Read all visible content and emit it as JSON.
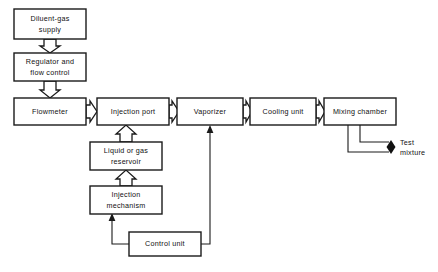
{
  "figure": {
    "type": "block-flow-diagram",
    "background": "#ffffff",
    "line_color": "#1a1a1a",
    "text_color": "#111111",
    "width": 438,
    "height": 272
  },
  "boxes": {
    "diluent_gas_supply": {
      "label": "Diluent-gas supply",
      "line1": "Diluent-gas",
      "line2": "supply",
      "x": 14,
      "y": 9,
      "w": 72,
      "h": 30
    },
    "regulator_flow_control": {
      "label": "Regulator and flow control",
      "line1": "Regulator and",
      "line2": "flow control",
      "x": 14,
      "y": 53,
      "w": 72,
      "h": 28
    },
    "flowmeter": {
      "label": "Flowmeter",
      "line1": "Flowmeter",
      "line2": "",
      "x": 14,
      "y": 98,
      "w": 72,
      "h": 27
    },
    "injection_port": {
      "label": "Injection port",
      "line1": "Injection port",
      "line2": "",
      "x": 97,
      "y": 98,
      "w": 72,
      "h": 27
    },
    "vaporizer": {
      "label": "Vaporizer",
      "line1": "Vaporizer",
      "line2": "",
      "x": 177,
      "y": 98,
      "w": 66,
      "h": 27
    },
    "cooling_unit": {
      "label": "Cooling unit",
      "line1": "Cooling unit",
      "line2": "",
      "x": 250,
      "y": 98,
      "w": 66,
      "h": 27
    },
    "mixing_chamber": {
      "label": "Mixing chamber",
      "line1": "Mixing chamber",
      "line2": "",
      "x": 324,
      "y": 98,
      "w": 72,
      "h": 27
    },
    "liquid_or_gas_reservoir": {
      "label": "Liquid or gas reservoir",
      "line1": "Liquid or gas",
      "line2": "reservoir",
      "x": 90,
      "y": 142,
      "w": 72,
      "h": 28
    },
    "injection_mechanism": {
      "label": "Injection mechanism",
      "line1": "Injection",
      "line2": "mechanism",
      "x": 90,
      "y": 186,
      "w": 72,
      "h": 28
    },
    "control_unit": {
      "label": "Control unit",
      "line1": "Control unit",
      "line2": "",
      "x": 129,
      "y": 232,
      "w": 72,
      "h": 24
    }
  },
  "output_label": {
    "label": "Test mixture",
    "line1": "Test",
    "line2": "mixture",
    "x": 400,
    "y": 146
  },
  "flow_chain": [
    "Diluent-gas supply",
    "Regulator and flow control",
    "Flowmeter",
    "Injection port",
    "Vaporizer",
    "Cooling unit",
    "Mixing chamber",
    "Test mixture"
  ],
  "connections": [
    {
      "from": "Diluent-gas supply",
      "to": "Regulator and flow control",
      "style": "hollow-block-arrow",
      "direction": "down"
    },
    {
      "from": "Regulator and flow control",
      "to": "Flowmeter",
      "style": "hollow-block-arrow",
      "direction": "down"
    },
    {
      "from": "Flowmeter",
      "to": "Injection port",
      "style": "hollow-block-arrow",
      "direction": "right"
    },
    {
      "from": "Injection port",
      "to": "Vaporizer",
      "style": "hollow-block-arrow",
      "direction": "right"
    },
    {
      "from": "Vaporizer",
      "to": "Cooling unit",
      "style": "hollow-block-arrow",
      "direction": "right"
    },
    {
      "from": "Cooling unit",
      "to": "Mixing chamber",
      "style": "hollow-block-arrow",
      "direction": "right"
    },
    {
      "from": "Liquid or gas reservoir",
      "to": "Injection port",
      "style": "hollow-block-arrow",
      "direction": "up"
    },
    {
      "from": "Injection mechanism",
      "to": "Liquid or gas reservoir",
      "style": "hollow-block-arrow",
      "direction": "up"
    },
    {
      "from": "Control unit",
      "to": "Injection mechanism",
      "style": "thin-line-arrow",
      "direction": "up-left"
    },
    {
      "from": "Control unit",
      "to": "Vaporizer",
      "style": "thin-line-arrow",
      "direction": "up-right"
    },
    {
      "from": "Mixing chamber",
      "to": "Test mixture",
      "style": "thin-line-pair",
      "direction": "down-right"
    }
  ]
}
